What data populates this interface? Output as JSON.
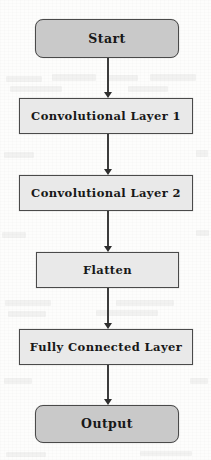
{
  "figure": {
    "kind": "flowchart",
    "orientation": "vertical",
    "background_color": "#fdfdfc",
    "terminal_fill": "#c9c9c9",
    "process_fill": "#e9e9e9",
    "border_color": "#4a4a4a",
    "arrow_color": "#3c3c3c",
    "text_color": "#181818"
  },
  "nodes": [
    {
      "id": "start",
      "label": "Start",
      "shape": "rounded-rectangle",
      "role": "terminal",
      "x": 35,
      "y": 19,
      "w": 144,
      "h": 39,
      "font_size": 12.5
    },
    {
      "id": "conv1",
      "label": "Convolutional Layer 1",
      "shape": "rectangle",
      "role": "process",
      "x": 19,
      "y": 98,
      "w": 174,
      "h": 36,
      "font_size": 11.5
    },
    {
      "id": "conv2",
      "label": "Convolutional Layer 2",
      "shape": "rectangle",
      "role": "process",
      "x": 19,
      "y": 175,
      "w": 174,
      "h": 36,
      "font_size": 11.5
    },
    {
      "id": "flatten",
      "label": "Flatten",
      "shape": "rectangle",
      "role": "process",
      "x": 36,
      "y": 252,
      "w": 143,
      "h": 36,
      "font_size": 11.5
    },
    {
      "id": "fc",
      "label": "Fully Connected Layer",
      "shape": "rectangle",
      "role": "process",
      "x": 19,
      "y": 329,
      "w": 174,
      "h": 36,
      "font_size": 11.5
    },
    {
      "id": "output",
      "label": "Output",
      "shape": "rounded-rectangle",
      "role": "terminal",
      "x": 35,
      "y": 405,
      "w": 144,
      "h": 38,
      "font_size": 12.5
    }
  ],
  "edges": [
    {
      "id": "e1",
      "from": "start",
      "to": "conv1",
      "x": 107,
      "y": 58,
      "length": 40,
      "arrowhead": "solid-triangle"
    },
    {
      "id": "e2",
      "from": "conv1",
      "to": "conv2",
      "x": 107,
      "y": 134,
      "length": 41,
      "arrowhead": "solid-triangle"
    },
    {
      "id": "e3",
      "from": "conv2",
      "to": "flatten",
      "x": 107,
      "y": 211,
      "length": 41,
      "arrowhead": "solid-triangle"
    },
    {
      "id": "e4",
      "from": "flatten",
      "to": "fc",
      "x": 107,
      "y": 288,
      "length": 41,
      "arrowhead": "solid-triangle"
    },
    {
      "id": "e5",
      "from": "fc",
      "to": "output",
      "x": 107,
      "y": 365,
      "length": 40,
      "arrowhead": "solid-triangle"
    }
  ],
  "scan_artifacts": [
    {
      "x": 6,
      "y": 76,
      "w": 36,
      "h": 6
    },
    {
      "x": 52,
      "y": 74,
      "w": 44,
      "h": 7
    },
    {
      "x": 108,
      "y": 75,
      "w": 30,
      "h": 6
    },
    {
      "x": 150,
      "y": 74,
      "w": 46,
      "h": 7
    },
    {
      "x": 10,
      "y": 86,
      "w": 52,
      "h": 6
    },
    {
      "x": 128,
      "y": 86,
      "w": 40,
      "h": 6
    },
    {
      "x": 4,
      "y": 152,
      "w": 30,
      "h": 6
    },
    {
      "x": 196,
      "y": 150,
      "w": 12,
      "h": 7
    },
    {
      "x": 2,
      "y": 232,
      "w": 24,
      "h": 6
    },
    {
      "x": 196,
      "y": 230,
      "w": 13,
      "h": 6
    },
    {
      "x": 5,
      "y": 300,
      "w": 46,
      "h": 6
    },
    {
      "x": 116,
      "y": 300,
      "w": 58,
      "h": 6
    },
    {
      "x": 8,
      "y": 311,
      "w": 38,
      "h": 6
    },
    {
      "x": 96,
      "y": 310,
      "w": 62,
      "h": 6
    },
    {
      "x": 4,
      "y": 378,
      "w": 28,
      "h": 6
    },
    {
      "x": 190,
      "y": 378,
      "w": 18,
      "h": 6
    },
    {
      "x": 6,
      "y": 452,
      "w": 40,
      "h": 5
    },
    {
      "x": 140,
      "y": 451,
      "w": 52,
      "h": 5
    }
  ]
}
